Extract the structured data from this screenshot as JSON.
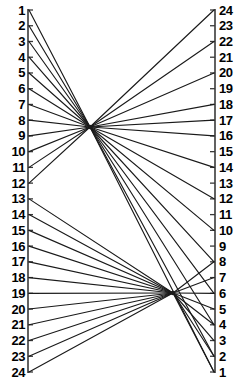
{
  "figure": {
    "width": 244,
    "height": 381,
    "background_color": "#ffffff",
    "line_color": "#1a1a1a",
    "axis_color": "#3a3a3a"
  },
  "axes": {
    "left": {
      "name": "left-scale",
      "x": 28,
      "y_top": 10,
      "y_bottom": 372,
      "tick_length": 5,
      "tick_side": "right",
      "labels": [
        "1",
        "2",
        "3",
        "4",
        "5",
        "6",
        "7",
        "8",
        "9",
        "10",
        "11",
        "12",
        "13",
        "14",
        "15",
        "16",
        "17",
        "18",
        "19",
        "20",
        "21",
        "22",
        "23",
        "24"
      ]
    },
    "right": {
      "name": "right-scale",
      "x": 215,
      "y_top": 10,
      "y_bottom": 372,
      "tick_length": 5,
      "tick_side": "left",
      "labels": [
        "24",
        "23",
        "22",
        "21",
        "20",
        "19",
        "18",
        "17",
        "16",
        "15",
        "14",
        "13",
        "12",
        "11",
        "10",
        "9",
        "8",
        "7",
        "6",
        "5",
        "4",
        "3",
        "2",
        "1"
      ]
    }
  },
  "nodes": [
    {
      "name": "upper-node",
      "id": "A",
      "x": 90,
      "y": 127
    },
    {
      "name": "lower-node",
      "id": "B",
      "x": 173,
      "y": 293
    }
  ],
  "chart_data": {
    "type": "line",
    "xlabel": "",
    "ylabel": "",
    "grid": false,
    "legend": "none",
    "node_positions": {
      "A": [
        90,
        127
      ],
      "B": [
        173,
        293
      ]
    },
    "left_axis_values": [
      1,
      2,
      3,
      4,
      5,
      6,
      7,
      8,
      9,
      10,
      11,
      12,
      13,
      14,
      15,
      16,
      17,
      18,
      19,
      20,
      21,
      22,
      23,
      24
    ],
    "right_axis_values": [
      24,
      23,
      22,
      21,
      20,
      19,
      18,
      17,
      16,
      15,
      14,
      13,
      12,
      11,
      10,
      9,
      8,
      7,
      6,
      5,
      4,
      3,
      2,
      1
    ],
    "left_to_node": [
      {
        "left": 1,
        "node": "A"
      },
      {
        "left": 2,
        "node": "A"
      },
      {
        "left": 3,
        "node": "A"
      },
      {
        "left": 4,
        "node": "A"
      },
      {
        "left": 5,
        "node": "A"
      },
      {
        "left": 6,
        "node": "A"
      },
      {
        "left": 7,
        "node": "A"
      },
      {
        "left": 8,
        "node": "A"
      },
      {
        "left": 9,
        "node": "A"
      },
      {
        "left": 10,
        "node": "A"
      },
      {
        "left": 11,
        "node": "A"
      },
      {
        "left": 12,
        "node": "A"
      },
      {
        "left": 13,
        "node": "B"
      },
      {
        "left": 14,
        "node": "B"
      },
      {
        "left": 15,
        "node": "B"
      },
      {
        "left": 16,
        "node": "B"
      },
      {
        "left": 17,
        "node": "B"
      },
      {
        "left": 18,
        "node": "B"
      },
      {
        "left": 19,
        "node": "B"
      },
      {
        "left": 20,
        "node": "B"
      },
      {
        "left": 21,
        "node": "B"
      },
      {
        "left": 22,
        "node": "B"
      },
      {
        "left": 23,
        "node": "B"
      },
      {
        "left": 24,
        "node": "B"
      }
    ],
    "node_to_right": [
      {
        "node": "A",
        "right": 24
      },
      {
        "node": "A",
        "right": 22
      },
      {
        "node": "A",
        "right": 20
      },
      {
        "node": "A",
        "right": 18
      },
      {
        "node": "A",
        "right": 17
      },
      {
        "node": "A",
        "right": 16
      },
      {
        "node": "A",
        "right": 14
      },
      {
        "node": "A",
        "right": 12
      },
      {
        "node": "A",
        "right": 10
      },
      {
        "node": "A",
        "right": 8
      },
      {
        "node": "A",
        "right": 6
      },
      {
        "node": "A",
        "right": 4
      },
      {
        "node": "A",
        "right": 2
      },
      {
        "node": "A",
        "right": 1
      },
      {
        "node": "B",
        "right": 8
      },
      {
        "node": "B",
        "right": 7
      },
      {
        "node": "B",
        "right": 6
      },
      {
        "node": "B",
        "right": 5
      },
      {
        "node": "B",
        "right": 4
      },
      {
        "node": "B",
        "right": 3
      },
      {
        "node": "B",
        "right": 2
      },
      {
        "node": "B",
        "right": 1
      }
    ]
  }
}
